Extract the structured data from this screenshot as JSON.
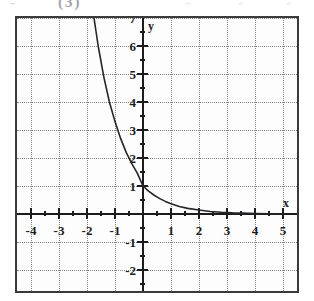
{
  "artifact_header": {
    "fragments": [
      "-",
      "(3)",
      "-",
      "-",
      "-"
    ]
  },
  "graph": {
    "x_axis_name": "x",
    "y_axis_name": "y",
    "x_tick_labels": [
      {
        "value": -4,
        "label": "-4"
      },
      {
        "value": -3,
        "label": "-3"
      },
      {
        "value": -2,
        "label": "-2"
      },
      {
        "value": -1,
        "label": "-1"
      },
      {
        "value": 1,
        "label": "1"
      },
      {
        "value": 2,
        "label": "2"
      },
      {
        "value": 3,
        "label": "3"
      },
      {
        "value": 4,
        "label": "4"
      },
      {
        "value": 5,
        "label": "5"
      }
    ],
    "y_tick_labels": [
      {
        "value": 7,
        "label": "7"
      },
      {
        "value": 6,
        "label": "6"
      },
      {
        "value": 5,
        "label": "5"
      },
      {
        "value": 4,
        "label": "4"
      },
      {
        "value": 3,
        "label": "3"
      },
      {
        "value": 2,
        "label": "2"
      },
      {
        "value": 1,
        "label": "1"
      },
      {
        "value": -1,
        "label": "-1"
      },
      {
        "value": -2,
        "label": "-2"
      }
    ],
    "colors": {
      "frame": "#3a3a3c",
      "grid": "#6e6e72",
      "axis": "#1c1c1e",
      "curve": "#262628",
      "background": "#fdfdfd"
    }
  },
  "chart_data": {
    "type": "line",
    "title": "",
    "xlabel": "x",
    "ylabel": "y",
    "xlim": [
      -5,
      5.4
    ],
    "ylim": [
      -2.8,
      7.4
    ],
    "grid": true,
    "legend": null,
    "x_ticks": [
      -4,
      -3,
      -2,
      -1,
      1,
      2,
      3,
      4,
      5
    ],
    "y_ticks": [
      7,
      6,
      5,
      4,
      3,
      2,
      1,
      -1,
      -2
    ],
    "x_tick_labels": [
      "-4",
      "-3",
      "-2",
      "-1",
      "1",
      "2",
      "3",
      "4",
      "5"
    ],
    "y_tick_labels": [
      "7",
      "6",
      "5",
      "4",
      "3",
      "2",
      "1",
      "-1",
      "-2"
    ],
    "series": [
      {
        "name": "exponential decay",
        "description": "decreasing exponential through (0,1), asymptotic to the x-axis for large x",
        "x": [
          -1.75,
          -1.6,
          -1.4,
          -1.2,
          -1.0,
          -0.8,
          -0.6,
          -0.4,
          -0.2,
          0.0,
          0.2,
          0.4,
          0.6,
          0.8,
          1.0,
          1.3,
          1.6,
          2.0,
          2.4,
          2.8,
          3.2,
          3.6,
          4.0,
          4.5,
          5.0
        ],
        "y": [
          7.0,
          6.0,
          4.9,
          4.0,
          3.3,
          2.7,
          2.2,
          1.8,
          1.45,
          1.0,
          0.82,
          0.67,
          0.55,
          0.45,
          0.37,
          0.27,
          0.2,
          0.14,
          0.09,
          0.06,
          0.04,
          0.03,
          0.02,
          0.01,
          0.0
        ]
      }
    ],
    "annotations": [
      {
        "text": "y-intercept at (0, 1)"
      },
      {
        "text": "horizontal asymptote y = 0"
      }
    ]
  }
}
